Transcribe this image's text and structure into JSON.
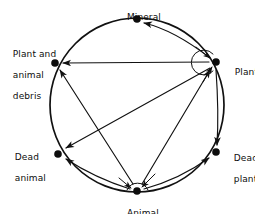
{
  "diagram": {
    "type": "cycle-diagram",
    "background_color": "#ffffff",
    "stroke_color": "#111111",
    "node_fill_color": "#0d0d0d",
    "circle": {
      "cx": 137,
      "cy": 105,
      "r": 87
    },
    "nodes": [
      {
        "id": "mineral",
        "label": "Mineral",
        "x": 137,
        "y": 19,
        "self_loop": false
      },
      {
        "id": "plant",
        "label": "Plant",
        "x": 216,
        "y": 62,
        "self_loop": true
      },
      {
        "id": "dead-plant",
        "label": "Dead\nplant",
        "x": 216,
        "y": 152,
        "self_loop": false
      },
      {
        "id": "animal",
        "label": "Animal",
        "x": 137,
        "y": 191,
        "self_loop": true
      },
      {
        "id": "dead-animal",
        "label": "Dead\nanimal",
        "x": 58,
        "y": 154,
        "self_loop": false
      },
      {
        "id": "debris",
        "label": "Plant and\nanimal\ndebris",
        "x": 55,
        "y": 63,
        "self_loop": false
      }
    ],
    "edges": [
      {
        "id": "plant-to-mineral",
        "from": "plant",
        "to": "mineral",
        "arrow": true
      },
      {
        "id": "plant-to-debris",
        "from": "plant",
        "to": "debris",
        "arrow": true
      },
      {
        "id": "plant-to-dead-animal",
        "from": "plant",
        "to": "dead-animal",
        "arrow": true
      },
      {
        "id": "plant-to-dead-plant",
        "from": "plant",
        "to": "dead-plant",
        "arrow": true
      },
      {
        "id": "plant-self-loop",
        "from": "plant",
        "to": "plant",
        "arrow": true
      },
      {
        "id": "animal-to-debris",
        "from": "animal",
        "to": "debris",
        "arrow": true
      },
      {
        "id": "animal-to-dead-animal",
        "from": "animal",
        "to": "dead-animal",
        "arrow": true
      },
      {
        "id": "animal-to-dead-plant",
        "from": "animal",
        "to": "dead-plant",
        "arrow": true
      },
      {
        "id": "animal-to-plant",
        "from": "animal",
        "to": "plant",
        "arrow": true
      },
      {
        "id": "animal-self-loop",
        "from": "animal",
        "to": "animal",
        "arrow": true
      }
    ],
    "labels": {
      "mineral": "Mineral",
      "plant": "Plant",
      "dead_plant_line1": "Dead",
      "dead_plant_line2": "plant",
      "animal": "Animal",
      "dead_animal_line1": "Dead",
      "dead_animal_line2": "animal",
      "debris_line1": "Plant and",
      "debris_line2": "animal",
      "debris_line3": "debris"
    }
  }
}
